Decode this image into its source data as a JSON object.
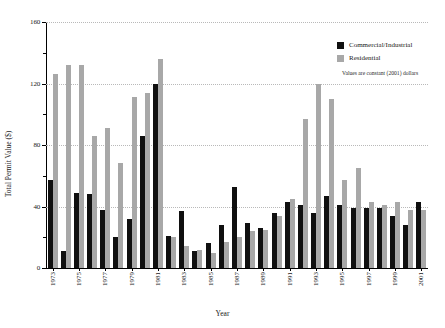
{
  "axes": {
    "ylabel": "Total Permit Value ($)",
    "xlabel": "Year",
    "yticks": [
      "0",
      "40",
      "80",
      "120",
      "160"
    ]
  },
  "legend": {
    "items": [
      {
        "label": "Commercial/Industrial",
        "color": "#101010",
        "key": "commercial"
      },
      {
        "label": "Residential",
        "color": "#a8a8a8",
        "key": "residential"
      }
    ],
    "note": "Values are constant (2001) dollars"
  },
  "chart_data": {
    "type": "bar",
    "title": "",
    "xlabel": "Year",
    "ylabel": "Total Permit Value ($)",
    "ylim": [
      0,
      160
    ],
    "yticks": [
      0,
      40,
      80,
      120,
      160
    ],
    "grid": true,
    "legend_position": "top-right",
    "annotation": "Values are constant (2001) dollars",
    "categories": [
      "1973",
      "1974",
      "1975",
      "1976",
      "1977",
      "1978",
      "1979",
      "1980",
      "1981",
      "1982",
      "1983",
      "1984",
      "1985",
      "1986",
      "1987",
      "1988",
      "1989",
      "1990",
      "1991",
      "1992",
      "1993",
      "1994",
      "1995",
      "1996",
      "1997",
      "1998",
      "1999",
      "2000",
      "2001"
    ],
    "tick_categories": [
      "1973",
      "1975",
      "1977",
      "1979",
      "1981",
      "1983",
      "1985",
      "1987",
      "1989",
      "1991",
      "1993",
      "1995",
      "1997",
      "1999",
      "2001"
    ],
    "series": [
      {
        "name": "Commercial/Industrial",
        "color": "#101010",
        "values": [
          57,
          11,
          49,
          48,
          38,
          20,
          32,
          86,
          120,
          21,
          37,
          11,
          16,
          28,
          53,
          29,
          26,
          36,
          43,
          41,
          36,
          47,
          41,
          39,
          39,
          39,
          34,
          28,
          43
        ]
      },
      {
        "name": "Residential",
        "color": "#a8a8a8",
        "values": [
          126,
          132,
          132,
          86,
          91,
          68,
          111,
          114,
          136,
          20,
          14,
          12,
          10,
          17,
          20,
          24,
          25,
          34,
          45,
          97,
          120,
          110,
          57,
          65,
          43,
          41,
          43,
          38,
          38
        ]
      }
    ]
  }
}
